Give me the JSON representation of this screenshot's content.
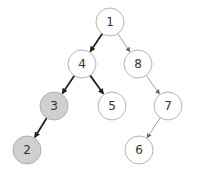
{
  "diagram": {
    "type": "binary-tree",
    "colors": {
      "node_fill_default": "#ffffff",
      "node_fill_highlight": "#d0d0d0",
      "node_stroke": "#aaaaaa",
      "edge_highlight": "#222222",
      "edge_default": "#888888",
      "label": "#333333"
    },
    "node_radius": 14,
    "nodes": [
      {
        "id": "n1",
        "label": "1",
        "x": 110,
        "y": 22,
        "highlight": false
      },
      {
        "id": "n4",
        "label": "4",
        "x": 82,
        "y": 64,
        "highlight": false
      },
      {
        "id": "n8",
        "label": "8",
        "x": 138,
        "y": 64,
        "highlight": false
      },
      {
        "id": "n3",
        "label": "3",
        "x": 54,
        "y": 106,
        "highlight": true
      },
      {
        "id": "n5",
        "label": "5",
        "x": 112,
        "y": 106,
        "highlight": false
      },
      {
        "id": "n7",
        "label": "7",
        "x": 168,
        "y": 106,
        "highlight": false
      },
      {
        "id": "n2",
        "label": "2",
        "x": 27,
        "y": 150,
        "highlight": true
      },
      {
        "id": "n6",
        "label": "6",
        "x": 139,
        "y": 150,
        "highlight": false
      }
    ],
    "edges": [
      {
        "from": "n1",
        "to": "n4",
        "highlight": true
      },
      {
        "from": "n1",
        "to": "n8",
        "highlight": false
      },
      {
        "from": "n4",
        "to": "n3",
        "highlight": true
      },
      {
        "from": "n4",
        "to": "n5",
        "highlight": true
      },
      {
        "from": "n8",
        "to": "n7",
        "highlight": false
      },
      {
        "from": "n3",
        "to": "n2",
        "highlight": true
      },
      {
        "from": "n7",
        "to": "n6",
        "highlight": false
      }
    ]
  }
}
